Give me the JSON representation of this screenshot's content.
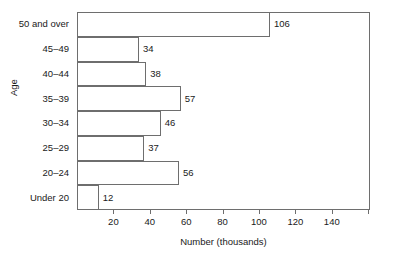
{
  "chart_data": {
    "type": "bar",
    "orientation": "horizontal",
    "title": "",
    "xlabel": "Number (thousands)",
    "ylabel": "Age",
    "categories": [
      "Under 20",
      "20–24",
      "25–29",
      "30–34",
      "35–39",
      "40–44",
      "45–49",
      "50 and over"
    ],
    "values": [
      12,
      56,
      37,
      46,
      57,
      38,
      34,
      106
    ],
    "data_labels": [
      "12",
      "56",
      "37",
      "46",
      "57",
      "38",
      "34",
      "106"
    ],
    "xlim": [
      0,
      161
    ],
    "ylim": [
      0,
      8
    ],
    "xticks": [
      20,
      40,
      60,
      80,
      100,
      120,
      140
    ],
    "xtick_labels": [
      "20",
      "40",
      "60",
      "80",
      "100",
      "120",
      "140"
    ],
    "grid": false,
    "legend": null,
    "bar_fill_color": "#ffffff",
    "bar_edge_color": "#6e6e6e",
    "axis_color": "#6e6e6e",
    "text_color": "#1a1a1a",
    "background_color": "#ffffff",
    "bars_contiguous": true
  }
}
